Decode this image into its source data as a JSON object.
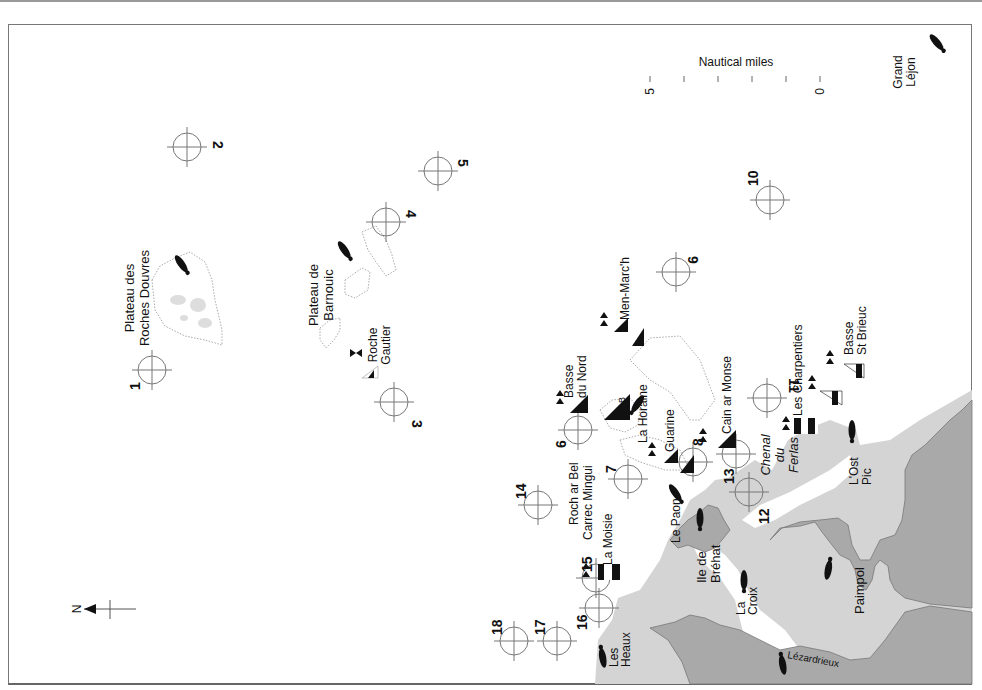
{
  "map": {
    "title": "Nautical chart - Plateau des Roches Douvres to Paimpol",
    "orientation": "rotated 90° (north points left)",
    "north_arrow": {
      "label": "N"
    },
    "scale_bar": {
      "title": "Nautical miles",
      "ticks": [
        "5",
        "",
        "",
        "",
        "",
        "0"
      ]
    },
    "colors": {
      "land": "#a9a9a9",
      "foreshore": "#d4d4d4",
      "sea": "#ffffff",
      "ink": "#111111",
      "circle": "#777777"
    },
    "dive_sites": [
      {
        "num": "1"
      },
      {
        "num": "2"
      },
      {
        "num": "3"
      },
      {
        "num": "4"
      },
      {
        "num": "5"
      },
      {
        "num": "6"
      },
      {
        "num": "7"
      },
      {
        "num": "8"
      },
      {
        "num": "9"
      },
      {
        "num": "10"
      },
      {
        "num": "11"
      },
      {
        "num": "12"
      },
      {
        "num": "13"
      },
      {
        "num": "14"
      },
      {
        "num": "15"
      },
      {
        "num": "16"
      },
      {
        "num": "17"
      },
      {
        "num": "18"
      }
    ],
    "place_labels": {
      "roches_douvres": [
        "Plateau des",
        "Roches Douvres"
      ],
      "barnouic": [
        "Plateau de",
        "Barnouic"
      ],
      "roche_gautier": [
        "Roche",
        "Gautier"
      ],
      "grand_lejon": [
        "Grand",
        "Léjon"
      ],
      "men_march": "Men-Marc'h",
      "basse_du_nord": [
        "Basse",
        "du Nord"
      ],
      "la_horaine": "La Horaine",
      "horaine_b": "B",
      "guarine": "Guarine",
      "cain_ar_monse": "Cain ar Monse",
      "chenal_du_ferlas": [
        "Chenal",
        "du",
        "Ferlas"
      ],
      "les_charpentiers": "Les Charpentiers",
      "basse_st_brieuc": [
        "Basse",
        "St Brieuc"
      ],
      "lost_pic": [
        "L'Ost",
        "Pic"
      ],
      "roch_ar_bel": "Roch ar Bel",
      "carrec_mingui": "Carrec Mingui",
      "la_moisie": "La Moisie",
      "le_paon": "Le Paon",
      "ile_de_brehat": [
        "Ile de",
        "Bréhat"
      ],
      "la_croix": [
        "La",
        "Croix"
      ],
      "paimpol": "Paimpol",
      "lezardrieux": "Lézardrieux",
      "les_heaux": [
        "Les",
        "Heaux"
      ]
    }
  }
}
